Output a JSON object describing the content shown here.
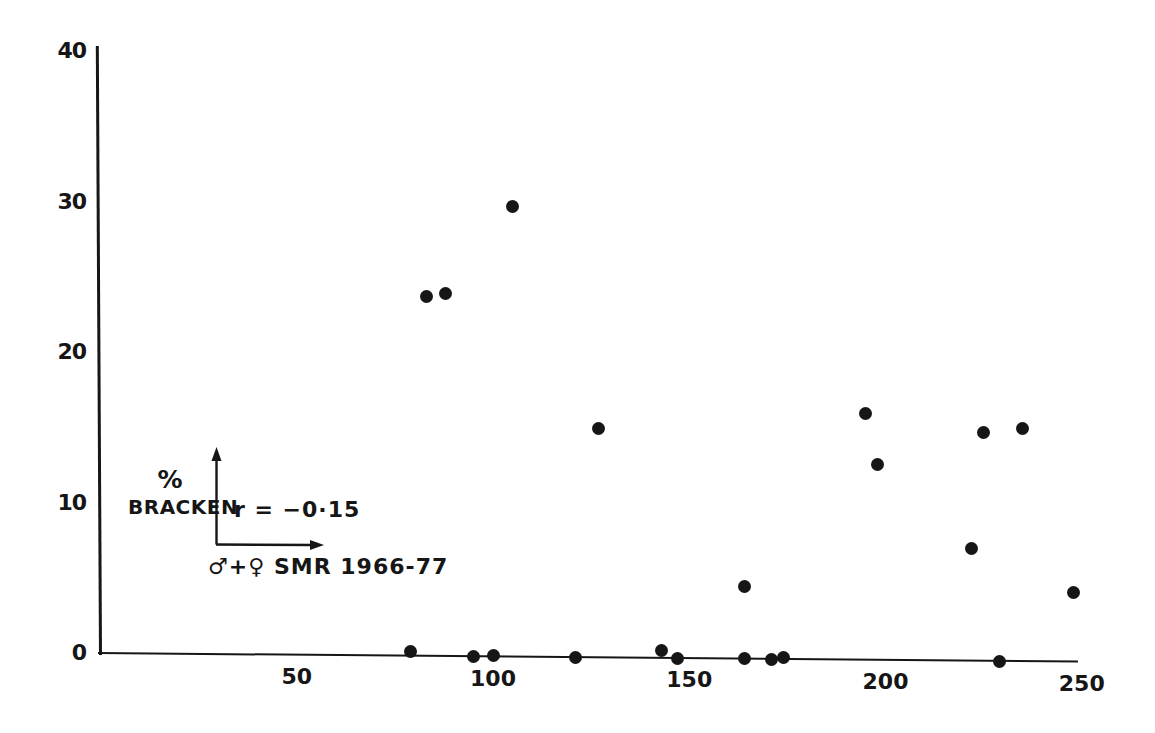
{
  "colors": {
    "ink": "#161616",
    "background": "#ffffff"
  },
  "chart_data": {
    "type": "scatter",
    "title": "",
    "xlabel": "♂+♀ SMR 1966-77",
    "ylabel": "% BRACKEN",
    "ylabel_lines": [
      "%",
      "BRACKEN"
    ],
    "annotation": "r = −0·15",
    "x_ticks": [
      50,
      100,
      150,
      200,
      250
    ],
    "y_ticks": [
      0,
      10,
      20,
      30,
      40
    ],
    "xlim": [
      0,
      255
    ],
    "ylim": [
      0,
      40
    ],
    "grid": false,
    "legend": false,
    "marker": {
      "shape": "circle",
      "color": "#161616"
    },
    "points": [
      {
        "x": 79,
        "y": 0.3
      },
      {
        "x": 83,
        "y": 23.9
      },
      {
        "x": 88,
        "y": 24.1
      },
      {
        "x": 95,
        "y": 0
      },
      {
        "x": 100,
        "y": 0.1
      },
      {
        "x": 105,
        "y": 29.9
      },
      {
        "x": 121,
        "y": 0
      },
      {
        "x": 127,
        "y": 15.2
      },
      {
        "x": 143,
        "y": 0.5
      },
      {
        "x": 147,
        "y": 0
      },
      {
        "x": 164,
        "y": 4.8
      },
      {
        "x": 164,
        "y": 0
      },
      {
        "x": 171,
        "y": 0
      },
      {
        "x": 174,
        "y": 0.1
      },
      {
        "x": 195,
        "y": 16.4
      },
      {
        "x": 198,
        "y": 13.0
      },
      {
        "x": 222,
        "y": 7.5
      },
      {
        "x": 225,
        "y": 15.2
      },
      {
        "x": 229,
        "y": 0
      },
      {
        "x": 235,
        "y": 15.5
      },
      {
        "x": 248,
        "y": 4.6
      }
    ]
  }
}
